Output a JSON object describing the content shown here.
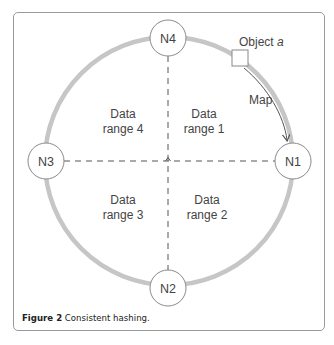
{
  "figure": {
    "nodes": [
      {
        "id": "N1",
        "label": "N1",
        "position": "right"
      },
      {
        "id": "N2",
        "label": "N2",
        "position": "bottom"
      },
      {
        "id": "N3",
        "label": "N3",
        "position": "left"
      },
      {
        "id": "N4",
        "label": "N4",
        "position": "top"
      }
    ],
    "ranges": [
      {
        "line1": "Data",
        "line2": "range 1"
      },
      {
        "line1": "Data",
        "line2": "range 2"
      },
      {
        "line1": "Data",
        "line2": "range 3"
      },
      {
        "line1": "Data",
        "line2": "range 4"
      }
    ],
    "object_label": "Object",
    "object_var": "a",
    "map_label": "Map",
    "caption_bold": "Figure 2",
    "caption_text": " Consistent hashing.",
    "colors": {
      "ring": "#c6c6c6",
      "node_border": "#8a8a8a",
      "text": "#444444",
      "dashed": "#555555",
      "frame": "#9a9a9a"
    }
  }
}
